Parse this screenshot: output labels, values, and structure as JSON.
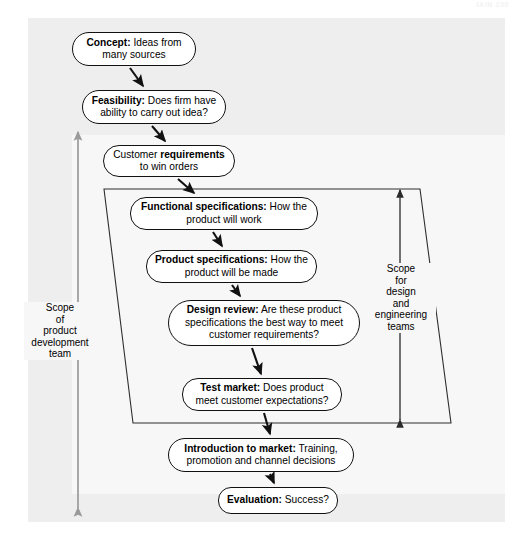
{
  "page": {
    "faint_header": "IAIN 230",
    "background": "#ffffff",
    "panel_color": "#eeeeee",
    "panel_inner_color": "#f7f7f7",
    "line_color": "#111111",
    "scope_arrow_color": "#9a9a9a"
  },
  "diagram": {
    "type": "flowchart",
    "nodes": [
      {
        "id": "concept",
        "lead": "Concept:",
        "rest": " Ideas from many sources",
        "full": "Concept: Ideas from many sources",
        "x": 72,
        "y": 32,
        "w": 124,
        "h": 34,
        "radius": 17
      },
      {
        "id": "feasibility",
        "lead": "Feasibility:",
        "rest": " Does firm have ability to carry out idea?",
        "full": "Feasibility: Does firm have ability to carry out idea?",
        "x": 82,
        "y": 90,
        "w": 144,
        "h": 34,
        "radius": 17
      },
      {
        "id": "customer-requirements",
        "lead": "Customer ",
        "bold_mid": "requirements",
        "rest": " to win orders",
        "full": "Customer requirements to win orders",
        "x": 103,
        "y": 145,
        "w": 132,
        "h": 32,
        "radius": 16
      },
      {
        "id": "functional-specifications",
        "lead": "Functional specifications:",
        "rest": " How the product will work",
        "full": "Functional specifications: How the product will work",
        "x": 130,
        "y": 197,
        "w": 188,
        "h": 33,
        "radius": 16
      },
      {
        "id": "product-specifications",
        "lead": "Product specifications:",
        "rest": " How the product will be made",
        "full": "Product specifications: How the product will be made",
        "x": 146,
        "y": 250,
        "w": 171,
        "h": 33,
        "radius": 16
      },
      {
        "id": "design-review",
        "lead": "Design review:",
        "rest": " Are these product specifications the best way to meet customer requirements?",
        "full": "Design review: Are these product specifications the best way to meet customer requirements?",
        "x": 168,
        "y": 300,
        "w": 192,
        "h": 46,
        "radius": 23
      },
      {
        "id": "test-market",
        "lead": "Test market:",
        "rest": " Does product meet customer expectations?",
        "full": "Test market: Does product meet customer expectations?",
        "x": 182,
        "y": 378,
        "w": 160,
        "h": 33,
        "radius": 16
      },
      {
        "id": "introduction-to-market",
        "lead": "Introduction to market:",
        "rest": " Training, promotion and channel decisions",
        "full": "Introduction to market: Training, promotion and channel decisions",
        "x": 168,
        "y": 438,
        "w": 186,
        "h": 34,
        "radius": 17
      },
      {
        "id": "evaluation",
        "lead": "Evaluation:",
        "rest": " Success?",
        "full": "Evaluation: Success?",
        "x": 218,
        "y": 487,
        "w": 120,
        "h": 27,
        "radius": 13
      }
    ],
    "scope_left": {
      "label_lines": [
        "Scope",
        "of",
        "product",
        "development",
        "team"
      ],
      "full": "Scope of product development team",
      "x": 48,
      "y": 302
    },
    "scope_right": {
      "label_lines": [
        "Scope",
        "for",
        "design",
        "and",
        "engineering",
        "teams"
      ],
      "full": "Scope for design and engineering teams",
      "x": 386,
      "y": 263
    },
    "parallelogram": {
      "points": "104,189 420,189 451,423 133,423",
      "description": "scope boundary for design and engineering teams"
    }
  }
}
